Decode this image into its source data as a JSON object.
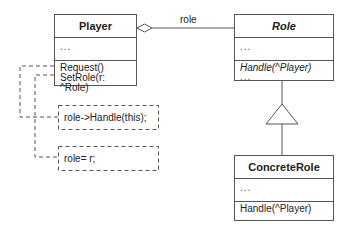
{
  "diagram": {
    "type": "UML class diagram",
    "classes": {
      "player": {
        "name": "Player",
        "attributes": "...",
        "operations": [
          "Request()",
          "SetRole(r: ^Role)"
        ]
      },
      "role": {
        "name": "Role",
        "abstract": true,
        "attributes": "...",
        "operations": [
          "Handle(^Player)",
          "..."
        ]
      },
      "concrete_role": {
        "name": "ConcreteRole",
        "attributes": "...",
        "operations": [
          "Handle(^Player)",
          "..."
        ]
      }
    },
    "associations": {
      "aggregation_label": "role"
    },
    "notes": [
      "role->Handle(this);",
      "role= r;"
    ],
    "colors": {
      "line": "#555555",
      "text": "#222222",
      "background": "#ffffff"
    }
  }
}
